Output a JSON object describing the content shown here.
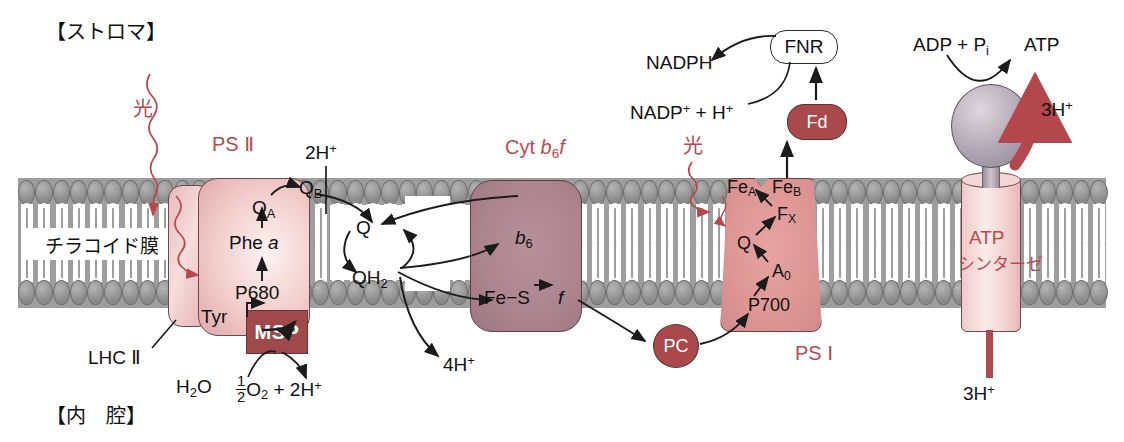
{
  "diagram": {
    "title_regions": {
      "stroma": "【ストロマ】",
      "lumen": "【内　腔】",
      "membrane": "チラコイド膜"
    },
    "complex_labels": {
      "psii": "PS Ⅱ",
      "lhcii": "LHC Ⅱ",
      "cytb6f_prefix": "Cyt ",
      "cytb6f_b": "b",
      "cytb6f_b_sub": "6",
      "cytb6f_f": "f",
      "psi": "PS Ⅰ",
      "atp_synthase_line1": "ATP",
      "atp_synthase_line2": "シンターゼ",
      "msp": "MSP",
      "pc": "PC",
      "fd": "Fd",
      "fnr": "FNR"
    },
    "light_labels": [
      {
        "text": "光",
        "position": "psii"
      },
      {
        "text": "光",
        "position": "psi"
      }
    ],
    "psii_chain": {
      "qb": "Q",
      "qb_sub": "B",
      "qa": "Q",
      "qa_sub": "A",
      "phe": "Phe ",
      "phe_ital": "a",
      "p680": "P680",
      "tyr": "Tyr"
    },
    "quinone_pool": {
      "q": "Q",
      "qh2": "QH",
      "qh2_sub": "2"
    },
    "cytb6f_internal": {
      "b6": "b",
      "b6_sub": "6",
      "fes": "Fe−S",
      "f": "f"
    },
    "psi_chain": {
      "fea": "Fe",
      "fea_sub": "A",
      "feb": "Fe",
      "feb_sub": "B",
      "fx": "F",
      "fx_sub": "X",
      "q": "Q",
      "a0": "A",
      "a0_sub": "0",
      "p700": "P700"
    },
    "reactions": {
      "water": "H",
      "water_sub": "2",
      "water_tail": "O",
      "oxygen_num": "1",
      "oxygen_den": "2",
      "oxygen": "O",
      "oxygen_sub": "2",
      "plus": " + 2H",
      "plus_sup": "+",
      "protons_2h": "2H",
      "protons_2h_sup": "+",
      "protons_4h": "4H",
      "protons_4h_sup": "+",
      "protons_3h_top": "3H",
      "protons_3h_top_sup": "+",
      "protons_3h_bottom": "3H",
      "protons_3h_bottom_sup": "+",
      "nadph": "NADPH",
      "nadp_plus": "NADP",
      "nadp_sup": "+",
      "nadp_h": " + H",
      "nadp_h_sup": "+",
      "adp": "ADP + P",
      "adp_sub": "i",
      "atp": "ATP"
    },
    "colors": {
      "accent_red": "#bb4a4e",
      "membrane_gray": "#9e9e9e",
      "psii_fill": "#f2cdcb",
      "cytb6f_fill": "#ab8490",
      "psi_fill": "#dd9694",
      "msp_fill": "#a0494a",
      "atp_head_fill": "#b9afbb",
      "proton_arrow": "#b3484c"
    }
  }
}
